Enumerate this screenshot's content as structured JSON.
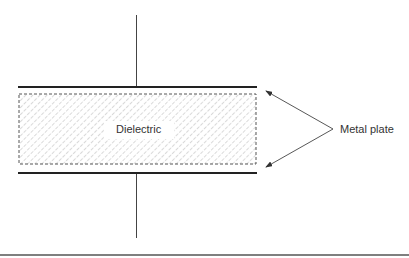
{
  "diagram": {
    "type": "parallel-plate-capacitor",
    "labels": {
      "dielectric": "Dielectric",
      "metal_plate": "Metal plate"
    },
    "colors": {
      "line": "#222222",
      "hatch": "#9a9a9a",
      "background": "#ffffff"
    }
  }
}
